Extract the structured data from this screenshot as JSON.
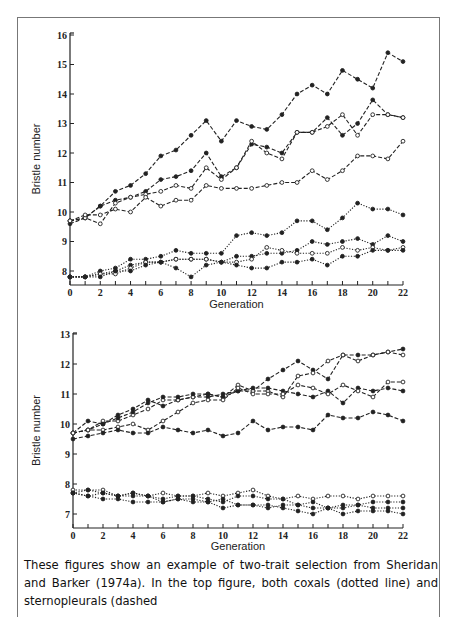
{
  "chart_data": [
    {
      "type": "line",
      "title": "",
      "xlabel": "Generation",
      "ylabel": "Bristle number",
      "xlim": [
        0,
        22
      ],
      "ylim": [
        7.6,
        16
      ],
      "xticks": [
        0,
        2,
        4,
        6,
        8,
        10,
        12,
        14,
        16,
        18,
        20,
        22
      ],
      "yticks": [
        8,
        9,
        10,
        11,
        12,
        13,
        14,
        15,
        16
      ],
      "x": [
        0,
        1,
        2,
        3,
        4,
        5,
        6,
        7,
        8,
        9,
        10,
        11,
        12,
        13,
        14,
        15,
        16,
        17,
        18,
        19,
        20,
        21,
        22
      ],
      "series": [
        {
          "name": "sternopleural-high",
          "style": "dashed",
          "marker": "filled",
          "values": [
            9.7,
            9.8,
            10.2,
            10.7,
            10.9,
            11.3,
            11.9,
            12.1,
            12.6,
            13.1,
            12.4,
            13.1,
            12.9,
            12.8,
            13.3,
            14.0,
            14.3,
            14.0,
            14.8,
            14.5,
            14.2,
            15.4,
            15.1
          ]
        },
        {
          "name": "sternopleural-mid-filled",
          "style": "dashed",
          "marker": "filled",
          "values": [
            9.6,
            9.8,
            10.2,
            10.4,
            10.5,
            10.7,
            11.1,
            11.2,
            11.4,
            12.0,
            11.2,
            11.5,
            12.3,
            12.2,
            12.0,
            12.7,
            12.7,
            13.2,
            12.6,
            13.0,
            13.8,
            13.3,
            13.2
          ]
        },
        {
          "name": "sternopleural-mid-open",
          "style": "dashed",
          "marker": "open",
          "values": [
            9.7,
            9.8,
            9.6,
            10.3,
            10.5,
            10.6,
            10.7,
            10.9,
            10.8,
            11.5,
            11.1,
            11.5,
            12.4,
            12.0,
            11.8,
            12.7,
            12.7,
            12.9,
            13.3,
            12.6,
            13.3,
            13.3,
            13.2
          ]
        },
        {
          "name": "sternopleural-low",
          "style": "dashed",
          "marker": "open",
          "values": [
            9.7,
            9.9,
            9.9,
            10.1,
            10.0,
            10.5,
            10.2,
            10.4,
            10.4,
            10.9,
            10.8,
            10.8,
            10.8,
            10.9,
            11.0,
            11.0,
            11.4,
            11.1,
            11.4,
            11.9,
            11.9,
            11.8,
            12.4
          ]
        },
        {
          "name": "coxal-high",
          "style": "dotted",
          "marker": "filled",
          "values": [
            7.8,
            7.8,
            8.0,
            8.1,
            8.4,
            8.4,
            8.5,
            8.7,
            8.6,
            8.6,
            8.6,
            9.2,
            9.3,
            9.2,
            9.3,
            9.7,
            9.7,
            9.4,
            9.8,
            10.3,
            10.1,
            10.1,
            9.9
          ]
        },
        {
          "name": "coxal-2",
          "style": "dotted",
          "marker": "filled",
          "values": [
            7.8,
            7.8,
            7.9,
            8.0,
            8.2,
            8.3,
            8.3,
            8.4,
            8.4,
            8.4,
            8.3,
            8.5,
            8.5,
            8.6,
            8.6,
            8.7,
            9.0,
            8.9,
            9.0,
            9.1,
            8.9,
            9.2,
            9.0
          ]
        },
        {
          "name": "coxal-3",
          "style": "dotted",
          "marker": "open",
          "values": [
            7.8,
            7.8,
            7.9,
            7.9,
            8.1,
            8.3,
            8.3,
            8.4,
            8.4,
            8.4,
            8.3,
            8.3,
            8.4,
            8.8,
            8.7,
            8.6,
            8.6,
            8.6,
            8.8,
            8.7,
            8.8,
            8.7,
            8.8
          ]
        },
        {
          "name": "coxal-4",
          "style": "dotted",
          "marker": "filled",
          "values": [
            7.8,
            7.8,
            7.8,
            8.0,
            8.0,
            8.2,
            8.3,
            8.1,
            7.8,
            8.2,
            8.3,
            8.2,
            8.1,
            8.1,
            8.3,
            8.3,
            8.4,
            8.2,
            8.5,
            8.5,
            8.7,
            8.7,
            8.7
          ]
        }
      ]
    },
    {
      "type": "line",
      "title": "",
      "xlabel": "Generation",
      "ylabel": "Bristle number",
      "xlim": [
        0,
        22
      ],
      "ylim": [
        6.85,
        13
      ],
      "xticks": [
        0,
        2,
        4,
        6,
        8,
        10,
        12,
        14,
        16,
        18,
        20,
        22
      ],
      "yticks": [
        7,
        8,
        9,
        10,
        11,
        12,
        13
      ],
      "x": [
        0,
        1,
        2,
        3,
        4,
        5,
        6,
        7,
        8,
        9,
        10,
        11,
        12,
        13,
        14,
        15,
        16,
        17,
        18,
        19,
        20,
        21,
        22
      ],
      "series": [
        {
          "name": "sternopleural-1",
          "style": "dashed",
          "marker": "filled",
          "values": [
            9.7,
            10.1,
            10.0,
            10.3,
            10.5,
            10.8,
            10.6,
            10.8,
            10.9,
            10.9,
            11.0,
            11.1,
            11.1,
            11.5,
            11.8,
            12.1,
            11.8,
            11.5,
            12.3,
            12.3,
            12.3,
            12.4,
            12.5
          ]
        },
        {
          "name": "sternopleural-2",
          "style": "dashed",
          "marker": "open",
          "values": [
            9.7,
            9.8,
            10.1,
            10.1,
            10.3,
            10.5,
            10.8,
            10.8,
            10.9,
            11.0,
            10.9,
            11.3,
            11.1,
            11.1,
            10.9,
            11.6,
            11.7,
            12.1,
            12.3,
            12.1,
            12.3,
            12.4,
            12.3
          ]
        },
        {
          "name": "sternopleural-3",
          "style": "dashed",
          "marker": "filled",
          "values": [
            9.7,
            9.8,
            10.0,
            10.2,
            10.4,
            10.7,
            10.9,
            10.9,
            11.0,
            11.0,
            10.9,
            11.1,
            11.2,
            11.2,
            11.1,
            11.0,
            10.9,
            11.1,
            10.7,
            11.2,
            11.1,
            11.2,
            11.1
          ]
        },
        {
          "name": "sternopleural-4",
          "style": "dashed",
          "marker": "open",
          "values": [
            9.7,
            9.8,
            9.8,
            9.9,
            10.0,
            9.8,
            10.1,
            10.4,
            10.7,
            10.8,
            10.8,
            11.2,
            11.0,
            11.0,
            11.0,
            11.3,
            11.2,
            11.0,
            11.3,
            11.1,
            10.9,
            11.4,
            11.4
          ]
        },
        {
          "name": "sternopleural-low",
          "style": "dashed",
          "marker": "filled",
          "values": [
            9.5,
            9.6,
            9.7,
            9.8,
            9.7,
            9.7,
            9.9,
            9.8,
            9.7,
            9.8,
            9.6,
            9.7,
            10.1,
            9.8,
            9.9,
            9.9,
            9.8,
            10.3,
            10.2,
            10.2,
            10.4,
            10.3,
            10.1
          ]
        },
        {
          "name": "coxal-1",
          "style": "dotted",
          "marker": "open",
          "values": [
            7.8,
            7.8,
            7.8,
            7.6,
            7.7,
            7.6,
            7.7,
            7.6,
            7.6,
            7.7,
            7.6,
            7.7,
            7.8,
            7.6,
            7.5,
            7.6,
            7.5,
            7.6,
            7.6,
            7.5,
            7.6,
            7.6,
            7.6
          ]
        },
        {
          "name": "coxal-2",
          "style": "dotted",
          "marker": "filled",
          "values": [
            7.7,
            7.8,
            7.7,
            7.6,
            7.7,
            7.6,
            7.5,
            7.6,
            7.6,
            7.5,
            7.4,
            7.6,
            7.6,
            7.5,
            7.5,
            7.3,
            7.4,
            7.2,
            7.3,
            7.3,
            7.4,
            7.4,
            7.4
          ]
        },
        {
          "name": "coxal-3",
          "style": "dotted",
          "marker": "filled",
          "values": [
            7.7,
            7.6,
            7.7,
            7.6,
            7.6,
            7.6,
            7.4,
            7.5,
            7.5,
            7.4,
            7.5,
            7.3,
            7.3,
            7.2,
            7.3,
            7.3,
            7.2,
            7.2,
            7.2,
            7.3,
            7.2,
            7.2,
            7.2
          ]
        },
        {
          "name": "coxal-4",
          "style": "dotted",
          "marker": "filled",
          "values": [
            7.7,
            7.6,
            7.5,
            7.5,
            7.4,
            7.4,
            7.4,
            7.5,
            7.4,
            7.4,
            7.2,
            7.3,
            7.3,
            7.3,
            7.2,
            7.1,
            7.0,
            7.2,
            7.0,
            7.1,
            7.1,
            7.1,
            7.0
          ]
        }
      ]
    }
  ],
  "caption": "These figures show an example of two-trait selection from Sheridan and Barker (1974a). In the top figure, both coxals (dotted line) and sternopleurals (dashed"
}
